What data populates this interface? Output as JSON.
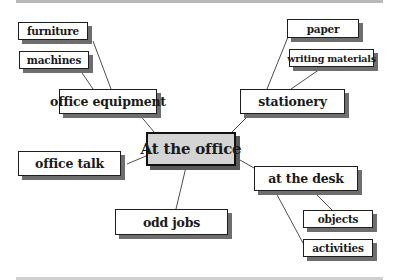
{
  "diagram": {
    "type": "mind-map",
    "colors": {
      "center_fill": "#d4d4d4",
      "node_fill": "#ffffff",
      "border": "#1e1e1e",
      "shadow": "#6e6e6e",
      "rule": "#b8b8b8"
    },
    "center": {
      "label": "At the office"
    },
    "branches": [
      {
        "label": "office equipment",
        "children": [
          {
            "label": "furniture"
          },
          {
            "label": "machines"
          }
        ]
      },
      {
        "label": "stationery",
        "children": [
          {
            "label": "paper"
          },
          {
            "label": "writing materials"
          }
        ]
      },
      {
        "label": "office talk",
        "children": []
      },
      {
        "label": "odd jobs",
        "children": []
      },
      {
        "label": "at the desk",
        "children": [
          {
            "label": "objects"
          },
          {
            "label": "activities"
          }
        ]
      }
    ]
  }
}
